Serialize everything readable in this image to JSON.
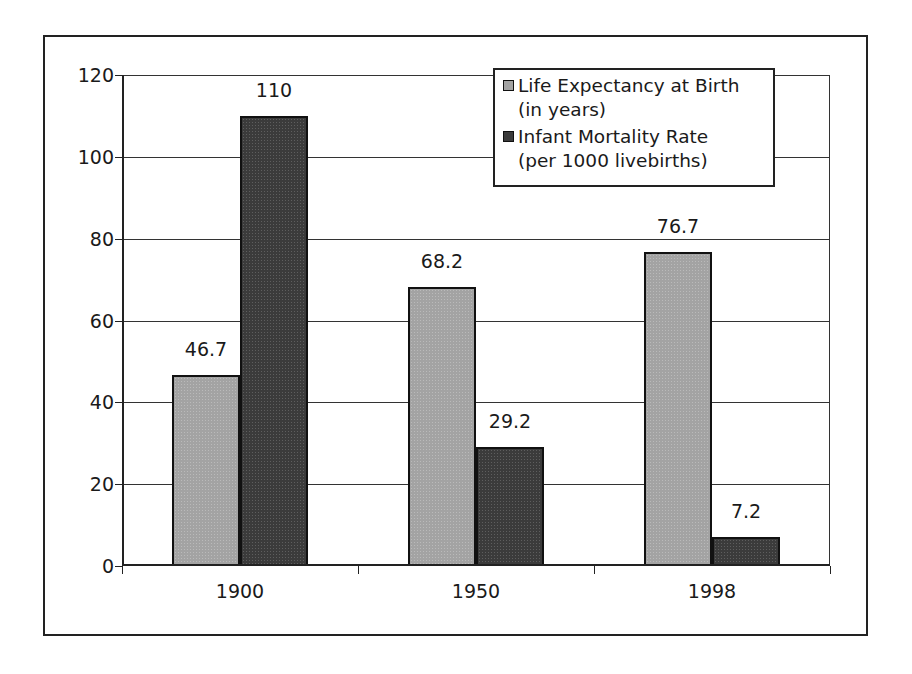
{
  "chart_data": {
    "type": "bar",
    "title": "",
    "xlabel": "",
    "ylabel": "",
    "categories": [
      "1900",
      "1950",
      "1998"
    ],
    "series": [
      {
        "name": "Life Expectancy at Birth (in years)",
        "values": [
          46.7,
          68.2,
          76.7
        ],
        "color": "#a3a3a3"
      },
      {
        "name": "Infant Mortality Rate (per 1000 livebirths)",
        "values": [
          110,
          29.2,
          7.2
        ],
        "color": "#3b3b3b"
      }
    ],
    "ylim": [
      0,
      120
    ],
    "yticks": [
      0,
      20,
      40,
      60,
      80,
      100,
      120
    ],
    "grid": true,
    "legend_position": "upper right (inside plot)",
    "data_labels": true
  },
  "legend": {
    "entries": [
      {
        "line1": "Life Expectancy at Birth",
        "line2": "(in years)"
      },
      {
        "line1": "Infant Mortality Rate",
        "line2": "(per 1000 livebirths)"
      }
    ]
  },
  "axis": {
    "y_labels": [
      "0",
      "20",
      "40",
      "60",
      "80",
      "100",
      "120"
    ],
    "x_labels": [
      "1900",
      "1950",
      "1998"
    ]
  },
  "labels": {
    "life": [
      "46.7",
      "68.2",
      "76.7"
    ],
    "infant": [
      "110",
      "29.2",
      "7.2"
    ]
  }
}
